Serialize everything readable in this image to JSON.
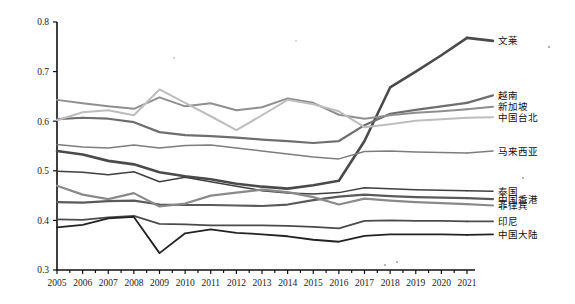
{
  "chart_data": {
    "type": "line",
    "title": "",
    "subtitle": "",
    "xlabel": "",
    "ylabel": "",
    "xlim": [
      2005,
      2021
    ],
    "ylim": [
      0.3,
      0.8
    ],
    "yticks": [
      "0.3",
      "0.4",
      "0.5",
      "0.6",
      "0.7",
      "0.8"
    ],
    "grid": false,
    "legend_position": "right-inline-labels",
    "x": [
      2005,
      2006,
      2007,
      2008,
      2009,
      2010,
      2011,
      2012,
      2013,
      2014,
      2015,
      2016,
      2017,
      2018,
      2019,
      2020,
      2021
    ],
    "categories": [
      "2005",
      "2006",
      "2007",
      "2008",
      "2009",
      "2010",
      "2011",
      "2012",
      "2013",
      "2014",
      "2015",
      "2016",
      "2017",
      "2018",
      "2019",
      "2020",
      "2021"
    ],
    "series": [
      {
        "name": "文莱",
        "color": "#4a4a4a",
        "width": 2.6,
        "label_y": 0.762,
        "values": [
          0.54,
          0.533,
          0.52,
          0.513,
          0.497,
          0.489,
          0.483,
          0.474,
          0.468,
          0.464,
          0.471,
          0.48,
          0.56,
          0.668,
          0.7,
          0.733,
          0.768
        ]
      },
      {
        "name": "越南",
        "color": "#6e6e6e",
        "width": 2.2,
        "label_y": 0.652,
        "values": [
          0.604,
          0.607,
          0.605,
          0.598,
          0.578,
          0.572,
          0.57,
          0.567,
          0.563,
          0.56,
          0.556,
          0.56,
          0.592,
          0.615,
          0.623,
          0.63,
          0.637
        ]
      },
      {
        "name": "新加坡",
        "color": "#8f8f8f",
        "width": 2.0,
        "label_y": 0.629,
        "values": [
          0.643,
          0.636,
          0.63,
          0.625,
          0.648,
          0.63,
          0.636,
          0.622,
          0.628,
          0.646,
          0.637,
          0.613,
          0.605,
          0.612,
          0.617,
          0.62,
          0.624
        ]
      },
      {
        "name": "中国台北",
        "color": "#bdbdbd",
        "width": 2.0,
        "label_y": 0.608,
        "values": [
          0.602,
          0.618,
          0.622,
          0.612,
          0.664,
          0.637,
          0.61,
          0.582,
          0.612,
          0.643,
          0.634,
          0.62,
          0.588,
          0.594,
          0.601,
          0.604,
          0.607
        ]
      },
      {
        "name": "马来西亚",
        "color": "#7d7d7d",
        "width": 1.5,
        "label_y": 0.54,
        "values": [
          0.553,
          0.548,
          0.546,
          0.552,
          0.546,
          0.551,
          0.552,
          0.546,
          0.54,
          0.534,
          0.528,
          0.524,
          0.539,
          0.54,
          0.538,
          0.537,
          0.536
        ]
      },
      {
        "name": "泰国",
        "color": "#3f3f3f",
        "width": 1.5,
        "label_y": 0.459,
        "values": [
          0.499,
          0.497,
          0.492,
          0.498,
          0.478,
          0.487,
          0.478,
          0.469,
          0.46,
          0.455,
          0.453,
          0.456,
          0.466,
          0.464,
          0.462,
          0.461,
          0.46
        ]
      },
      {
        "name": "中国香港",
        "color": "#5a5a5a",
        "width": 2.2,
        "label_y": 0.443,
        "values": [
          0.437,
          0.436,
          0.439,
          0.44,
          0.432,
          0.431,
          0.431,
          0.43,
          0.429,
          0.432,
          0.441,
          0.448,
          0.452,
          0.449,
          0.447,
          0.446,
          0.445
        ]
      },
      {
        "name": "菲律宾",
        "color": "#8a8a8a",
        "width": 2.2,
        "label_y": 0.43,
        "values": [
          0.47,
          0.452,
          0.443,
          0.455,
          0.428,
          0.434,
          0.45,
          0.456,
          0.462,
          0.457,
          0.447,
          0.432,
          0.444,
          0.44,
          0.437,
          0.435,
          0.433
        ]
      },
      {
        "name": "印尼",
        "color": "#4b4b4b",
        "width": 1.8,
        "label_y": 0.398,
        "values": [
          0.402,
          0.401,
          0.406,
          0.409,
          0.393,
          0.392,
          0.39,
          0.39,
          0.39,
          0.389,
          0.387,
          0.384,
          0.399,
          0.4,
          0.399,
          0.399,
          0.398
        ]
      },
      {
        "name": "中国大陆",
        "color": "#222222",
        "width": 1.8,
        "label_y": 0.372,
        "values": [
          0.386,
          0.391,
          0.404,
          0.407,
          0.334,
          0.374,
          0.382,
          0.375,
          0.372,
          0.368,
          0.361,
          0.357,
          0.369,
          0.372,
          0.372,
          0.372,
          0.371
        ]
      }
    ]
  }
}
